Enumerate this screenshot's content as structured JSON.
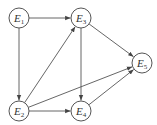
{
  "diagram": {
    "type": "directed-graph",
    "nodes": [
      {
        "id": "E1",
        "base": "E",
        "sub": "1",
        "x": 19,
        "y": 18
      },
      {
        "id": "E3",
        "base": "E",
        "sub": "3",
        "x": 81,
        "y": 18
      },
      {
        "id": "E5",
        "base": "E",
        "sub": "5",
        "x": 142,
        "y": 63
      },
      {
        "id": "E2",
        "base": "E",
        "sub": "2",
        "x": 19,
        "y": 111
      },
      {
        "id": "E4",
        "base": "E",
        "sub": "4",
        "x": 81,
        "y": 111
      }
    ],
    "edges": [
      {
        "from": "E1",
        "to": "E3"
      },
      {
        "from": "E1",
        "to": "E2"
      },
      {
        "from": "E2",
        "to": "E3"
      },
      {
        "from": "E2",
        "to": "E4"
      },
      {
        "from": "E2",
        "to": "E5"
      },
      {
        "from": "E3",
        "to": "E4"
      },
      {
        "from": "E3",
        "to": "E5"
      },
      {
        "from": "E4",
        "to": "E5"
      }
    ],
    "colors": {
      "stroke": "#555555",
      "fill": "#ffffff",
      "text": "#333333"
    }
  }
}
